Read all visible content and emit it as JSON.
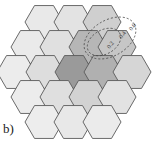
{
  "figure": {
    "panel_label": "b)",
    "caption_position": "bottom-left",
    "background_color": "#ffffff",
    "width": 152,
    "height": 147
  },
  "hex_grid": {
    "description": "hexagonal honeycomb cluster of flat-top hexagons",
    "hex_radius": 19,
    "stroke_color": "#5a5a5a",
    "stroke_width": 0.9,
    "shades": {
      "lightest": "#e8e8e8",
      "light": "#dcdcdc",
      "medium": "#c4c4c4",
      "dark": "#a8a8a8",
      "darkest": "#8f8f8f"
    },
    "cells": [
      {
        "name": "cell-r0-c0",
        "cx": 44,
        "cy": 22,
        "shade": "#e9e9e9"
      },
      {
        "name": "cell-r0-c1",
        "cx": 73,
        "cy": 22,
        "shade": "#e3e3e3"
      },
      {
        "name": "cell-r0-c2",
        "cx": 102,
        "cy": 22,
        "shade": "#cfcfcf"
      },
      {
        "name": "cell-r1-c0",
        "cx": 30,
        "cy": 47,
        "shade": "#eaeaea"
      },
      {
        "name": "cell-r1-c1",
        "cx": 59,
        "cy": 47,
        "shade": "#e0e0e0"
      },
      {
        "name": "cell-r1-c2",
        "cx": 88,
        "cy": 47,
        "shade": "#b6b6b6"
      },
      {
        "name": "cell-r1-c3",
        "cx": 117,
        "cy": 47,
        "shade": "#c6c6c6"
      },
      {
        "name": "cell-r2-c0",
        "cx": 16,
        "cy": 72,
        "shade": "#ececec"
      },
      {
        "name": "cell-r2-c1",
        "cx": 45,
        "cy": 72,
        "shade": "#dddddd"
      },
      {
        "name": "cell-r2-c2",
        "cx": 74,
        "cy": 72,
        "shade": "#9a9a9a"
      },
      {
        "name": "cell-r2-c3",
        "cx": 103,
        "cy": 72,
        "shade": "#b0b0b0"
      },
      {
        "name": "cell-r2-c4",
        "cx": 132,
        "cy": 72,
        "shade": "#d6d6d6"
      },
      {
        "name": "cell-r3-c0",
        "cx": 30,
        "cy": 97,
        "shade": "#ececec"
      },
      {
        "name": "cell-r3-c1",
        "cx": 59,
        "cy": 97,
        "shade": "#dfdfdf"
      },
      {
        "name": "cell-r3-c2",
        "cx": 88,
        "cy": 97,
        "shade": "#d2d2d2"
      },
      {
        "name": "cell-r3-c3",
        "cx": 117,
        "cy": 97,
        "shade": "#e2e2e2"
      },
      {
        "name": "cell-r4-c0",
        "cx": 44,
        "cy": 122,
        "shade": "#ededed"
      },
      {
        "name": "cell-r4-c1",
        "cx": 73,
        "cy": 122,
        "shade": "#e8e8e8"
      },
      {
        "name": "cell-r4-c2",
        "cx": 102,
        "cy": 122,
        "shade": "#ebebeb"
      }
    ]
  },
  "contours": {
    "description": "nested tilted elliptical dashed iso-level contours over the hex cluster",
    "center_x": 78,
    "center_y": 62,
    "rotation_deg": -26,
    "stroke_color": "#4a4a4a",
    "stroke_width": 0.8,
    "dash_pattern": "2,2",
    "rings": [
      {
        "name": "contour-ring-1",
        "rx": 16,
        "ry": 9
      },
      {
        "name": "contour-ring-2",
        "rx": 24,
        "ry": 13
      },
      {
        "name": "contour-ring-3",
        "rx": 31,
        "ry": 17
      },
      {
        "name": "contour-ring-4",
        "rx": 38,
        "ry": 21
      },
      {
        "name": "contour-ring-5",
        "rx": 45,
        "ry": 25
      },
      {
        "name": "contour-ring-6",
        "rx": 52,
        "ry": 29
      }
    ],
    "outer_lobes": [
      {
        "name": "contour-lobe-inner",
        "cx": 104,
        "cy": 42,
        "rx": 18,
        "ry": 12,
        "rotation_deg": -30
      },
      {
        "name": "contour-lobe-outer",
        "cx": 110,
        "cy": 38,
        "rx": 28,
        "ry": 18,
        "rotation_deg": -30
      }
    ],
    "labels": [
      {
        "name": "contour-label-1",
        "text": "0.2",
        "x": 112,
        "y": 46,
        "rotation_deg": -55
      },
      {
        "name": "contour-label-2",
        "text": "0.4",
        "x": 124,
        "y": 36,
        "rotation_deg": -55
      },
      {
        "name": "contour-label-3",
        "text": "0.6",
        "x": 134,
        "y": 28,
        "rotation_deg": -55
      }
    ]
  }
}
